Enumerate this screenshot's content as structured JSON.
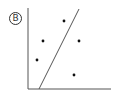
{
  "option_label": "B",
  "chart_data": {
    "type": "scatter",
    "title": "",
    "xlabel": "",
    "ylabel": "",
    "grid": false,
    "legend": null,
    "points": [
      {
        "x": 15,
        "y": 48
      },
      {
        "x": 9,
        "y": 29
      },
      {
        "x": 51,
        "y": 48
      },
      {
        "x": 46,
        "y": 14
      },
      {
        "x": 36,
        "y": 68
      }
    ],
    "trend_line": {
      "x1": 11,
      "y1": 0,
      "x2": 51,
      "y2": 80
    },
    "xlim": [
      0,
      83
    ],
    "ylim": [
      0,
      81
    ],
    "colors": {
      "axis": "#555555",
      "points": "#111111",
      "line": "#555555"
    }
  }
}
